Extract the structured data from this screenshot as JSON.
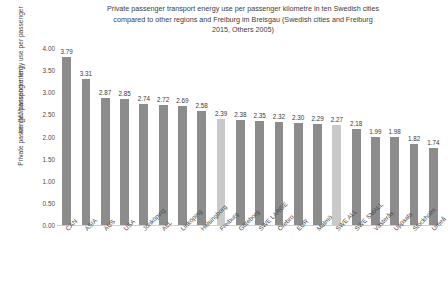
{
  "chart_data": {
    "type": "bar",
    "title": "Private passenger transport energy use per passenger kilometre in ten Swedish cities compared to other regions and Freiburg im Breisgau (Swedish cities and Freiburg 2015, Others 2005)",
    "title_lines": [
      "Private passenger transport energy use per passenger kilometre in ten Swedish cities",
      "compared to other regions and Freiburg im Breisgau (Swedish cities and Freiburg",
      "2015, Others 2005)"
    ],
    "xlabel": "",
    "ylabel": "Private passenger transport energy use per passenger km (MJ/passenger km)",
    "ylabel_lines": [
      "Private passenger transport energy use per passenger",
      "km (MJ/passenger km)"
    ],
    "ylim": [
      0,
      4.0
    ],
    "ytick_values": [
      0.0,
      0.5,
      1.0,
      1.5,
      2.0,
      2.5,
      3.0,
      3.5,
      4.0
    ],
    "ytick_labels": [
      "0.00",
      "0.50",
      "1.00",
      "1.50",
      "2.00",
      "2.50",
      "3.00",
      "3.50",
      "4.00"
    ],
    "grid": false,
    "legend": false,
    "categories": [
      "CAN",
      "ASIA",
      "AUS",
      "USA",
      "Jönköping",
      "ALL",
      "Linköping",
      "Helsingborg",
      "Freiburg",
      "Göteborg",
      "SWE LARGE",
      "Örebro",
      "EUR",
      "Malmö",
      "SWE ALL",
      "SWE SMALL",
      "Västerås",
      "Uppsala",
      "Stockholm",
      "Umeå"
    ],
    "values": [
      3.79,
      3.31,
      2.87,
      2.85,
      2.74,
      2.72,
      2.69,
      2.58,
      2.39,
      2.38,
      2.35,
      2.32,
      2.3,
      2.29,
      2.27,
      2.18,
      1.99,
      1.98,
      1.82,
      1.74
    ],
    "value_labels": [
      "3.79",
      "3.31",
      "2.87",
      "2.85",
      "2.74",
      "2.72",
      "2.69",
      "2.58",
      "2.39",
      "2.38",
      "2.35",
      "2.32",
      "2.30",
      "2.29",
      "2.27",
      "2.18",
      "1.99",
      "1.98",
      "1.82",
      "1.74"
    ],
    "highlighted": [
      false,
      false,
      false,
      false,
      false,
      false,
      false,
      false,
      true,
      false,
      false,
      false,
      false,
      false,
      true,
      false,
      false,
      false,
      false,
      false
    ],
    "colors": {
      "bar": "#8c8c8c",
      "bar_highlight": "#c9c9c9",
      "text": "#404040",
      "axis": "#d0d0d0",
      "background": "#ffffff"
    }
  }
}
